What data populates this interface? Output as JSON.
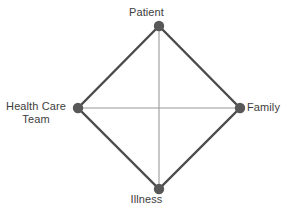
{
  "diagram": {
    "shape": "diamond",
    "background_color": "#ffffff",
    "node_color": "#585858",
    "perimeter_edge_color": "#4a4a4a",
    "inner_edge_color": "#9a9a9a",
    "label_color": "#3d3d3d",
    "nodes": [
      {
        "id": "patient",
        "label": "Patient",
        "position": "top",
        "x": 159,
        "y": 26,
        "label_x": 159,
        "label_y": 12
      },
      {
        "id": "family",
        "label": "Family",
        "position": "right",
        "x": 240,
        "y": 108,
        "label_x": 249,
        "label_y": 108
      },
      {
        "id": "illness",
        "label": "Illness",
        "position": "bottom",
        "x": 159,
        "y": 189,
        "label_x": 159,
        "label_y": 200
      },
      {
        "id": "health-care-team",
        "label": "Health Care Team",
        "label_line1": "Health Care",
        "label_line2": "Team",
        "position": "left",
        "x": 78,
        "y": 108,
        "label_x": 36,
        "label_y": 108
      }
    ],
    "edges": [
      {
        "id": "patient-family",
        "from": "patient",
        "to": "family",
        "style": "perimeter",
        "width": 2.4,
        "color": "#4a4a4a"
      },
      {
        "id": "family-illness",
        "from": "family",
        "to": "illness",
        "style": "perimeter",
        "width": 2.4,
        "color": "#4a4a4a"
      },
      {
        "id": "illness-health-care-team",
        "from": "illness",
        "to": "health-care-team",
        "style": "perimeter",
        "width": 2.4,
        "color": "#4a4a4a"
      },
      {
        "id": "health-care-team-patient",
        "from": "health-care-team",
        "to": "patient",
        "style": "perimeter",
        "width": 2.4,
        "color": "#4a4a4a"
      },
      {
        "id": "patient-illness",
        "from": "patient",
        "to": "illness",
        "style": "inner",
        "width": 1.1,
        "color": "#9a9a9a"
      },
      {
        "id": "health-care-team-family",
        "from": "health-care-team",
        "to": "family",
        "style": "inner",
        "width": 1.1,
        "color": "#9a9a9a"
      }
    ],
    "node_radius": 5.2
  }
}
